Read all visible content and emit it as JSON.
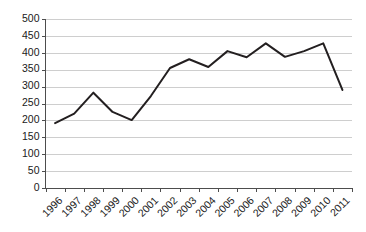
{
  "chart_data": {
    "type": "line",
    "title": "",
    "subtitle": "",
    "xlabel": "",
    "ylabel": "",
    "categories": [
      "1996",
      "1997",
      "1998",
      "1999",
      "2000",
      "2001",
      "2002",
      "2003",
      "2004",
      "2005",
      "2006",
      "2007",
      "2008",
      "2009",
      "2010",
      "2011"
    ],
    "values": [
      192,
      220,
      282,
      225,
      201,
      272,
      355,
      381,
      358,
      405,
      387,
      428,
      388,
      405,
      428,
      290
    ],
    "series": [
      {
        "name": "series-1",
        "values": [
          192,
          220,
          282,
          225,
          201,
          272,
          355,
          381,
          358,
          405,
          387,
          428,
          388,
          405,
          428,
          290
        ],
        "color": "#231f20"
      }
    ],
    "ylim": [
      0,
      500
    ],
    "ytick_step": 50,
    "ytick_labels": [
      "0",
      "50",
      "100",
      "150",
      "200",
      "250",
      "300",
      "350",
      "400",
      "450",
      "500"
    ],
    "ytick_values": [
      0,
      50,
      100,
      150,
      200,
      250,
      300,
      350,
      400,
      450,
      500
    ],
    "grid": true,
    "grid_axis": "y",
    "grid_color": "#c9c9c9",
    "legend": false,
    "legend_position": "none",
    "markers": false,
    "xtick_rotation": -45,
    "axis_color": "#4d4d4d",
    "background": "#ffffff",
    "annotations": []
  }
}
